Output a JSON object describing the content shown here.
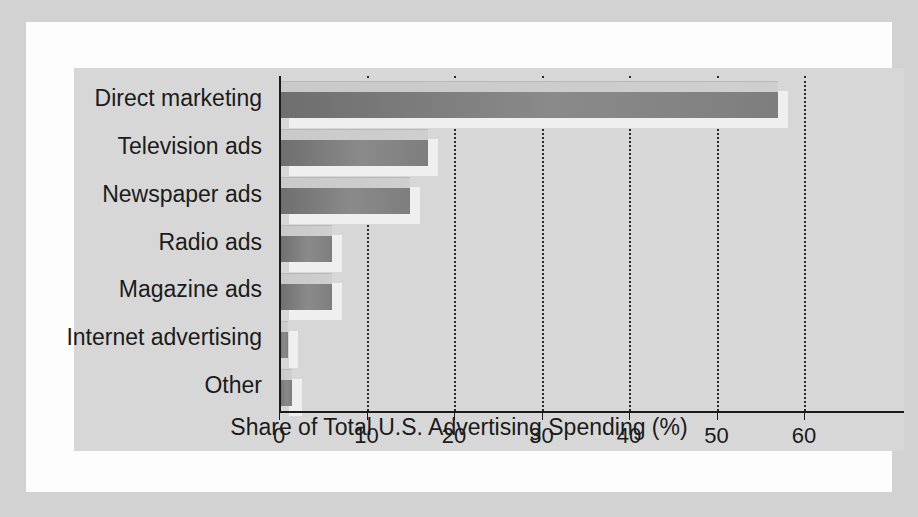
{
  "chart_data": {
    "type": "bar",
    "orientation": "horizontal",
    "title": "",
    "subtitle": "",
    "xlabel": "Share of Total U.S. Advertising Spending (%)",
    "ylabel": "",
    "categories": [
      "Direct marketing",
      "Television ads",
      "Newspaper ads",
      "Radio ads",
      "Magazine ads",
      "Internet advertising",
      "Other"
    ],
    "values": [
      57,
      17,
      15,
      6,
      6,
      1,
      1.5
    ],
    "xlim": [
      0,
      66
    ],
    "xticks": [
      0,
      10,
      20,
      30,
      40,
      50,
      60
    ],
    "xticklabels": [
      "0",
      "10",
      "20",
      "30",
      "40",
      "50",
      "60"
    ],
    "grid": "vertical dotted gridlines at each x tick",
    "legend": "none",
    "units": "percent"
  },
  "style": {
    "mount_color": "#d2d2d2",
    "card_color": "#fdfdfd",
    "panel_color": "#d7d7d7",
    "bar_color": "#7e7e7e",
    "bar_top_color": "#cccccc",
    "bar_shadow_color": "#efefef",
    "axis_color": "#1a1a1a",
    "text_color": "#1b1b1b"
  }
}
